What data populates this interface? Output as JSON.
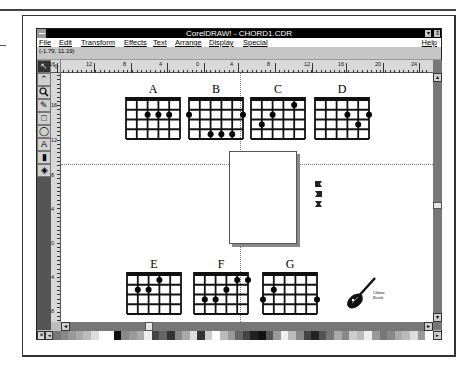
{
  "window": {
    "title": "CorelDRAW! - CHORD1.CDR",
    "minimize_glyph": "▾",
    "restore_glyph": "⇕"
  },
  "menu": {
    "items": [
      "File",
      "Edit",
      "Transform",
      "Effects",
      "Text",
      "Arrange",
      "Display",
      "Special"
    ],
    "help": "Help"
  },
  "status": {
    "coordinates": "(-1.79, 11.19)"
  },
  "rulers": {
    "horizontal_labels": [
      "16",
      "12",
      "8",
      "4",
      "0",
      "4",
      "8",
      "12",
      "16",
      "20",
      "24"
    ],
    "vertical_labels": [
      "16",
      "12",
      "8",
      "4",
      "0",
      "4",
      "8"
    ]
  },
  "toolbox": {
    "tools": [
      {
        "name": "pick-tool",
        "glyph": "↖"
      },
      {
        "name": "shape-tool",
        "glyph": "⌃"
      },
      {
        "name": "zoom-tool",
        "glyph": "🔍"
      },
      {
        "name": "pencil-tool",
        "glyph": "✎"
      },
      {
        "name": "rectangle-tool",
        "glyph": "□"
      },
      {
        "name": "ellipse-tool",
        "glyph": "◯"
      },
      {
        "name": "text-tool",
        "glyph": "A"
      },
      {
        "name": "outline-tool",
        "glyph": "▮"
      },
      {
        "name": "fill-tool",
        "glyph": "◈"
      }
    ]
  },
  "chords": [
    {
      "label": "A",
      "dots": [
        [
          1,
          2
        ],
        [
          1,
          3
        ],
        [
          1,
          4
        ]
      ]
    },
    {
      "label": "B",
      "dots": [
        [
          1,
          0
        ],
        [
          1,
          5
        ],
        [
          3,
          2
        ],
        [
          3,
          3
        ],
        [
          3,
          4
        ]
      ]
    },
    {
      "label": "C",
      "dots": [
        [
          0,
          4
        ],
        [
          1,
          2
        ],
        [
          2,
          1
        ]
      ]
    },
    {
      "label": "D",
      "dots": [
        [
          1,
          3
        ],
        [
          1,
          5
        ],
        [
          2,
          4
        ]
      ]
    },
    {
      "label": "E",
      "dots": [
        [
          0,
          3
        ],
        [
          1,
          1
        ],
        [
          1,
          2
        ]
      ]
    },
    {
      "label": "F",
      "dots": [
        [
          0,
          4
        ],
        [
          0,
          5
        ],
        [
          1,
          3
        ],
        [
          2,
          1
        ],
        [
          2,
          2
        ]
      ]
    },
    {
      "label": "G",
      "dots": [
        [
          1,
          1
        ],
        [
          2,
          0
        ],
        [
          2,
          5
        ]
      ]
    }
  ],
  "guitar": {
    "caption_line1": "Gibson",
    "caption_line2": "Bench"
  },
  "palette": {
    "colors": [
      "#777",
      "#888",
      "#999",
      "#aaa",
      "#bbb",
      "#ddd",
      "#fff",
      "#fff",
      "#111",
      "#888",
      "#999",
      "#aaa",
      "#eee",
      "#444",
      "#666",
      "#333",
      "#888",
      "#aaa",
      "#ddd",
      "#333",
      "#ccc",
      "#fff",
      "#bbb",
      "#999",
      "#666",
      "#444",
      "#222",
      "#111",
      "#555",
      "#999",
      "#eee",
      "#bbb",
      "#888",
      "#444",
      "#222",
      "#555",
      "#777",
      "#aaa",
      "#888",
      "#ccc",
      "#bbb",
      "#eee",
      "#999",
      "#777",
      "#888",
      "#aaa",
      "#bbb",
      "#ddd",
      "#999",
      "#fff"
    ]
  },
  "scrollbars": {
    "up_arrow": "▴",
    "down_arrow": "▾",
    "left_arrow": "◂",
    "right_arrow": "▸"
  }
}
